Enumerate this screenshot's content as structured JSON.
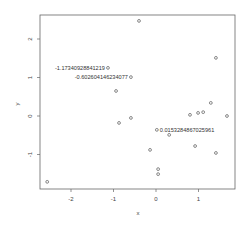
{
  "chart_data": {
    "type": "scatter",
    "title": "",
    "xlabel": "x",
    "ylabel": "y",
    "xlim": [
      -2.75,
      1.85
    ],
    "ylim": [
      -1.8,
      2.6
    ],
    "x_ticks": [
      -2,
      -1,
      0,
      1
    ],
    "x_tick_labels": [
      "-2",
      "-1",
      "0",
      "1"
    ],
    "y_ticks": [
      -1,
      0,
      1,
      2
    ],
    "y_tick_labels": [
      "-1",
      "0",
      "1",
      "2"
    ],
    "grid": false,
    "points": [
      {
        "x": -0.4,
        "y": 2.47
      },
      {
        "x": 1.41,
        "y": 1.51
      },
      {
        "x": -1.13,
        "y": 1.25,
        "label": "-1.17340928841219"
      },
      {
        "x": -0.59,
        "y": 1.01,
        "label": "-0.602604146234077"
      },
      {
        "x": -0.94,
        "y": 0.65
      },
      {
        "x": 1.29,
        "y": 0.34
      },
      {
        "x": -0.87,
        "y": -0.18
      },
      {
        "x": -0.59,
        "y": -0.05
      },
      {
        "x": 0.8,
        "y": 0.03
      },
      {
        "x": 0.99,
        "y": 0.08
      },
      {
        "x": 1.11,
        "y": 0.1
      },
      {
        "x": 1.67,
        "y": 0.0
      },
      {
        "x": 0.02,
        "y": -0.36,
        "label": "0.0153284867025961"
      },
      {
        "x": 0.31,
        "y": -0.49
      },
      {
        "x": -0.14,
        "y": -0.88
      },
      {
        "x": 0.92,
        "y": -0.78
      },
      {
        "x": 1.41,
        "y": -0.96
      },
      {
        "x": 0.05,
        "y": -1.38
      },
      {
        "x": 0.05,
        "y": -1.51
      },
      {
        "x": -2.56,
        "y": -1.71
      }
    ]
  }
}
